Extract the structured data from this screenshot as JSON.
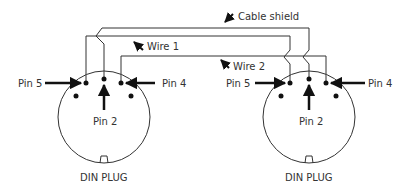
{
  "diagram": {
    "labels": {
      "cable_shield": "Cable shield",
      "wire1": "Wire 1",
      "wire2": "Wire 2"
    },
    "plugs": [
      {
        "name": "DIN PLUG",
        "pin_left": "Pin 5",
        "pin_right": "Pin 4",
        "pin_center": "Pin 2"
      },
      {
        "name": "DIN PLUG",
        "pin_left": "Pin 5",
        "pin_right": "Pin 4",
        "pin_center": "Pin 2"
      }
    ],
    "colors": {
      "line": "#333333",
      "pin": "#111111",
      "text": "#333333"
    }
  }
}
